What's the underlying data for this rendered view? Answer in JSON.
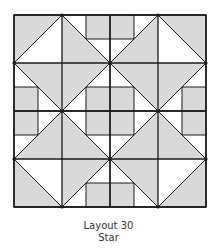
{
  "figure": {
    "title": "Layout 30",
    "subtitle": "Star",
    "colors": {
      "shaded": "#d9d9d9",
      "background": "#ffffff",
      "line": "#1a1a1a"
    },
    "grid_units": 8
  }
}
